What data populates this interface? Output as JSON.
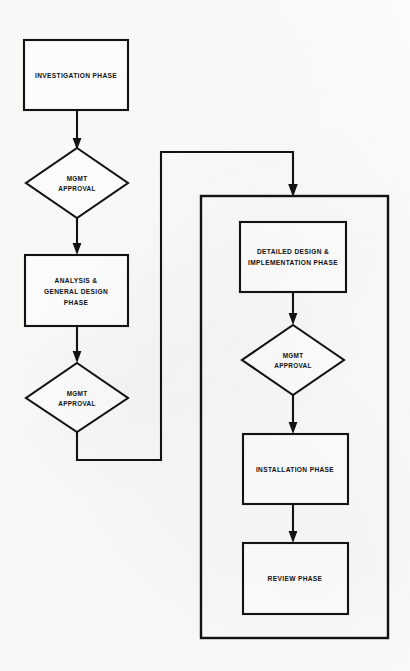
{
  "diagram": {
    "background_color": "#fbfbfa",
    "line_color": "#121212",
    "node_fill_color": "#ffffff"
  },
  "nodes": {
    "investigation_phase": {
      "label": "INVESTIGATION PHASE",
      "shape": "rectangle"
    },
    "mgmt_approval_1": {
      "label_line1": "MGMT",
      "label_line2": "APPROVAL",
      "shape": "diamond"
    },
    "analysis_general_design_phase": {
      "label_line1": "ANALYSIS &",
      "label_line2": "GENERAL DESIGN",
      "label_line3": "PHASE",
      "shape": "rectangle"
    },
    "mgmt_approval_2": {
      "label_line1": "MGMT",
      "label_line2": "APPROVAL",
      "shape": "diamond"
    },
    "detailed_design_implementation_phase": {
      "label_line1": "DETAILED DESIGN &",
      "label_line2": "IMPLEMENTATION PHASE",
      "shape": "rectangle"
    },
    "mgmt_approval_3": {
      "label_line1": "MGMT",
      "label_line2": "APPROVAL",
      "shape": "diamond"
    },
    "installation_phase": {
      "label": "INSTALLATION PHASE",
      "shape": "rectangle"
    },
    "review_phase": {
      "label": "REVIEW PHASE",
      "shape": "rectangle"
    },
    "implementation_group": {
      "label": "",
      "shape": "rectangle-container"
    }
  },
  "connectors": [
    {
      "from": "investigation_phase",
      "to": "mgmt_approval_1",
      "arrow": true
    },
    {
      "from": "mgmt_approval_1",
      "to": "analysis_general_design_phase",
      "arrow": true
    },
    {
      "from": "analysis_general_design_phase",
      "to": "mgmt_approval_2",
      "arrow": true
    },
    {
      "from": "mgmt_approval_2",
      "to": "implementation_group",
      "arrow": true,
      "routing": "down-right-up-right-down"
    },
    {
      "from": "detailed_design_implementation_phase",
      "to": "mgmt_approval_3",
      "arrow": true
    },
    {
      "from": "mgmt_approval_3",
      "to": "installation_phase",
      "arrow": true
    },
    {
      "from": "installation_phase",
      "to": "review_phase",
      "arrow": true
    }
  ]
}
